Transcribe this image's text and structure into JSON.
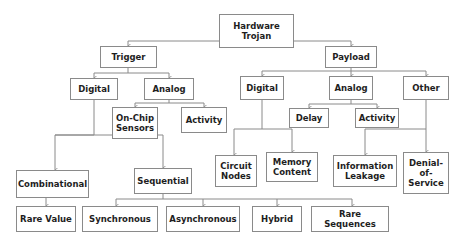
{
  "diagram": {
    "colors": {
      "border": "#8a8a8a",
      "text": "#1e1e1e",
      "line": "#8a8a8a",
      "background": "#ffffff"
    },
    "nodes": {
      "root": "Hardware\nTrojan",
      "trigger": "Trigger",
      "payload": "Payload",
      "trigger_digital": "Digital",
      "trigger_analog": "Analog",
      "onchip_sensors": "On-Chip\nSensors",
      "trigger_activity": "Activity",
      "payload_digital": "Digital",
      "payload_analog": "Analog",
      "payload_other": "Other",
      "delay": "Delay",
      "payload_activity": "Activity",
      "circuit_nodes": "Circuit\nNodes",
      "memory_content": "Memory\nContent",
      "information_leakage": "Information\nLeakage",
      "denial_of_service": "Denial-\nof-\nService",
      "combinational": "Combinational",
      "sequential": "Sequential",
      "rare_value": "Rare Value",
      "synchronous": "Synchronous",
      "asynchronous": "Asynchronous",
      "hybrid": "Hybrid",
      "rare_sequences": "Rare Sequences"
    },
    "edges": [
      [
        "root",
        "trigger"
      ],
      [
        "root",
        "payload"
      ],
      [
        "trigger",
        "trigger_digital"
      ],
      [
        "trigger",
        "trigger_analog"
      ],
      [
        "trigger_analog",
        "onchip_sensors"
      ],
      [
        "trigger_analog",
        "trigger_activity"
      ],
      [
        "trigger_digital",
        "combinational"
      ],
      [
        "trigger_digital",
        "sequential"
      ],
      [
        "combinational",
        "rare_value"
      ],
      [
        "sequential",
        "synchronous"
      ],
      [
        "sequential",
        "asynchronous"
      ],
      [
        "sequential",
        "hybrid"
      ],
      [
        "sequential",
        "rare_sequences"
      ],
      [
        "payload",
        "payload_digital"
      ],
      [
        "payload",
        "payload_analog"
      ],
      [
        "payload",
        "payload_other"
      ],
      [
        "payload_digital",
        "circuit_nodes"
      ],
      [
        "payload_digital",
        "memory_content"
      ],
      [
        "payload_analog",
        "delay"
      ],
      [
        "payload_analog",
        "payload_activity"
      ],
      [
        "payload_other",
        "information_leakage"
      ],
      [
        "payload_other",
        "denial_of_service"
      ]
    ]
  }
}
